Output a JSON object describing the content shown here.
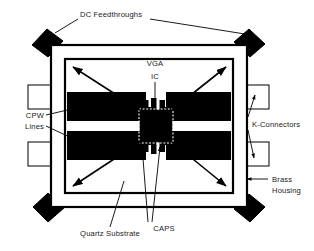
{
  "figure": {
    "background_color": "#ffffff",
    "ink_color": "#000000",
    "metal_color": "#000000",
    "substrate_color": "#ffffff"
  },
  "labels": {
    "dc_feedthroughs": "DC Feedthroughs",
    "vga": "VGA",
    "ic": "IC",
    "cpw": "CPW",
    "lines": "Lines",
    "k_connectors": "K-Connectors",
    "brass": "Brass",
    "housing": "Housing",
    "quartz_substrate": "Quartz Substrate",
    "caps": "CAPS"
  },
  "components": {
    "dc_feedthroughs": {
      "name": "DC Feedthroughs",
      "count": 4,
      "shape": "black diamond",
      "positions": [
        "top-left",
        "top-right",
        "bottom-left",
        "bottom-right"
      ]
    },
    "k_connectors": {
      "name": "K-Connectors",
      "count": 4,
      "shape": "outlined rectangle",
      "positions": [
        "left-upper",
        "left-lower",
        "right-upper",
        "right-lower"
      ]
    },
    "brass_housing": {
      "name": "Brass Housing",
      "shape": "square frame"
    },
    "quartz_substrate": {
      "name": "Quartz Substrate",
      "shape": "square"
    },
    "cpw_lines": {
      "name": "CPW Lines",
      "count": 2,
      "shape": "coplanar waveguide",
      "sides": [
        "left",
        "right"
      ]
    },
    "vga_ic": {
      "name": "VGA IC",
      "shape": "dashed square die"
    },
    "caps": {
      "name": "CAPS",
      "count": 2,
      "shape": "capacitor pads"
    }
  }
}
